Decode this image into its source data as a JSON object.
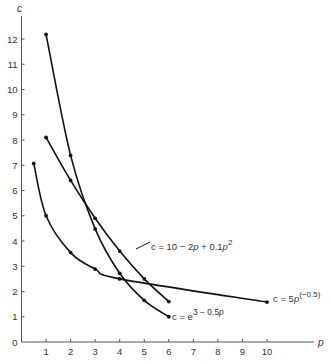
{
  "chart_data": {
    "type": "line",
    "title": "",
    "xlabel": "p",
    "ylabel": "c",
    "xlim": [
      0,
      12
    ],
    "ylim": [
      0,
      13
    ],
    "x_ticks": [
      1,
      2,
      3,
      4,
      5,
      6,
      7,
      8,
      9,
      10
    ],
    "y_ticks": [
      0,
      1,
      2,
      3,
      4,
      5,
      6,
      7,
      8,
      9,
      10,
      11,
      12
    ],
    "grid": false,
    "series": [
      {
        "name": "c = 5p^(-0.5)",
        "label_main": "c = 5",
        "label_p": "p",
        "label_sup": "(−0.5)",
        "x": [
          0.5,
          1,
          2,
          3,
          4,
          10
        ],
        "y": [
          7.07,
          5.0,
          3.54,
          2.89,
          2.5,
          1.58
        ]
      },
      {
        "name": "c = 10 − 2p + 0.1p^2",
        "label_main": "c = 10 − 2",
        "label_p": "p",
        "label_mid": " + 0.1",
        "label_p2": "p",
        "label_sup": "2",
        "x": [
          1,
          2,
          3,
          4,
          5,
          6
        ],
        "y": [
          8.1,
          6.4,
          4.9,
          3.6,
          2.5,
          1.6
        ]
      },
      {
        "name": "c = e^(3 − 0.5p)",
        "label_main": "c = e",
        "label_sup": "3 − 0.5",
        "label_p": "p",
        "x": [
          1,
          2,
          3,
          4,
          5,
          6
        ],
        "y": [
          12.18,
          7.39,
          4.48,
          2.72,
          1.65,
          1.0
        ]
      }
    ]
  }
}
